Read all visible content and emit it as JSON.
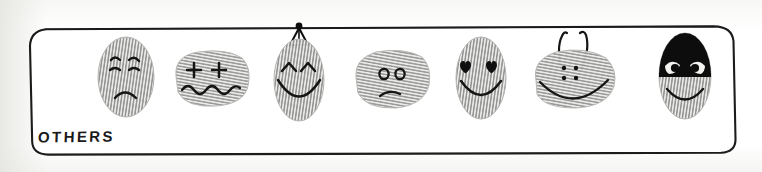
{
  "panel": {
    "label": "OTHERS",
    "border_color": "#1c1c1c",
    "background_color": "#ffffff",
    "style": "hand-drawn rounded rectangle"
  },
  "palette": {
    "ink": "#111111",
    "ridge_gray": "#9a9a98",
    "ridge_gray_light": "#bdbdbb",
    "mask_black": "#0d0d0d",
    "eye_white": "#f2f2f0",
    "paper": "#fdfdfb"
  },
  "faces": [
    {
      "index": 1,
      "name": "worried-sad-face",
      "shape": "tall-oval",
      "eyes": "dot-eyes-with-slanted-worried-eyebrows",
      "mouth": "frown",
      "accessory": "none",
      "x": 95,
      "y": 36,
      "w": 62,
      "h": 82
    },
    {
      "index": 2,
      "name": "dizzy-plus-eyes-face",
      "shape": "wide-blob",
      "eyes": "plus-signs",
      "mouth": "wavy-squiggle",
      "accessory": "none",
      "x": 168,
      "y": 46,
      "w": 84,
      "h": 62
    },
    {
      "index": 3,
      "name": "happy-face-with-bow",
      "shape": "tall-oval",
      "eyes": "caret-happy-eyes",
      "mouth": "big-smile",
      "accessory": "bow-on-top",
      "x": 271,
      "y": 36,
      "w": 56,
      "h": 84
    },
    {
      "index": 4,
      "name": "unamused-circle-eyes-face",
      "shape": "wide-blob",
      "eyes": "small-circle-eyes",
      "mouth": "slight-frown",
      "accessory": "none",
      "x": 350,
      "y": 47,
      "w": 82,
      "h": 62
    },
    {
      "index": 5,
      "name": "heart-eyes-love-face",
      "shape": "tall-oval",
      "eyes": "heart-eyes",
      "mouth": "big-smile",
      "accessory": "none",
      "x": 452,
      "y": 36,
      "w": 56,
      "h": 82
    },
    {
      "index": 6,
      "name": "antenna-bug-face",
      "shape": "wide-blob",
      "eyes": "four-dots-grid",
      "mouth": "wide-smile",
      "accessory": "two-antennae",
      "x": 528,
      "y": 30,
      "w": 92,
      "h": 80
    },
    {
      "index": 7,
      "name": "masked-bandit-face",
      "shape": "tall-oval",
      "eyes": "white-eyes-with-black-pupils-behind-mask",
      "mouth": "smile",
      "accessory": "black-burglar-mask",
      "x": 653,
      "y": 32,
      "w": 62,
      "h": 86
    }
  ]
}
